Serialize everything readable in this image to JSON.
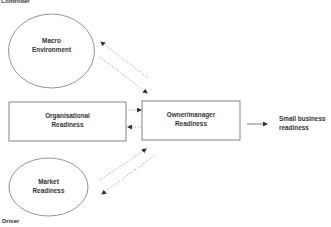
{
  "diagram": {
    "corner_labels": {
      "top_left": "Controller",
      "bottom_left": "Driver"
    },
    "nodes": {
      "macro": {
        "line1": "Macro",
        "line2": "Environment",
        "shape": "ellipse"
      },
      "organisational": {
        "line1": "Organisational",
        "line2": "Readiness",
        "shape": "rectangle"
      },
      "owner": {
        "line1": "Owner/manager",
        "line2": "Readiness",
        "shape": "rectangle"
      },
      "market": {
        "line1": "Market",
        "line2": "Readiness",
        "shape": "ellipse"
      },
      "outcome": {
        "line1": "Small business",
        "line2": "readiness",
        "shape": "text"
      }
    },
    "edges": [
      {
        "from": "owner",
        "to": "macro",
        "style": "dotted"
      },
      {
        "from": "macro",
        "to": "owner",
        "style": "dotted"
      },
      {
        "from": "organisational",
        "to": "owner",
        "style": "dotted"
      },
      {
        "from": "owner",
        "to": "organisational",
        "style": "dotted"
      },
      {
        "from": "market",
        "to": "owner",
        "style": "dotted"
      },
      {
        "from": "owner",
        "to": "market",
        "style": "dotted"
      },
      {
        "from": "owner",
        "to": "outcome",
        "style": "solid"
      }
    ],
    "colors": {
      "stroke": "#555555",
      "text": "#333333",
      "background": "#ffffff"
    }
  }
}
